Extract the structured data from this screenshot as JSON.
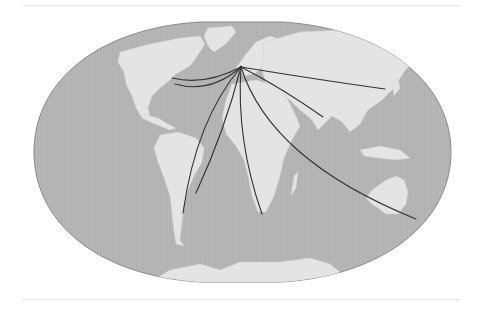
{
  "map": {
    "projection": "Robinson-like world map (flattened ellipse)",
    "colors": {
      "ocean": "#b3b3b3",
      "land": "#e4e4e4",
      "outline": "#8a8a8a",
      "route": "#333333",
      "rule": "#e6e6e6"
    },
    "hub": {
      "label": "",
      "x": 241,
      "y": 67
    },
    "routes": [
      {
        "name": "route-north-america-1",
        "end": [
          172,
          78
        ],
        "ctrl": [
          205,
          86
        ]
      },
      {
        "name": "route-north-america-2",
        "end": [
          175,
          84
        ],
        "ctrl": [
          210,
          94
        ]
      },
      {
        "name": "route-south-america-west",
        "end": [
          183,
          213
        ],
        "ctrl": [
          196,
          120
        ]
      },
      {
        "name": "route-brazil",
        "end": [
          196,
          193
        ],
        "ctrl": [
          225,
          130
        ]
      },
      {
        "name": "route-southern-africa",
        "end": [
          262,
          214
        ],
        "ctrl": [
          236,
          140
        ]
      },
      {
        "name": "route-india",
        "end": [
          323,
          117
        ],
        "ctrl": [
          282,
          88
        ]
      },
      {
        "name": "route-east-asia",
        "end": [
          385,
          89
        ],
        "ctrl": [
          320,
          80
        ]
      },
      {
        "name": "route-australia-nz",
        "end": [
          416,
          219
        ],
        "ctrl": [
          270,
          160
        ]
      }
    ]
  }
}
